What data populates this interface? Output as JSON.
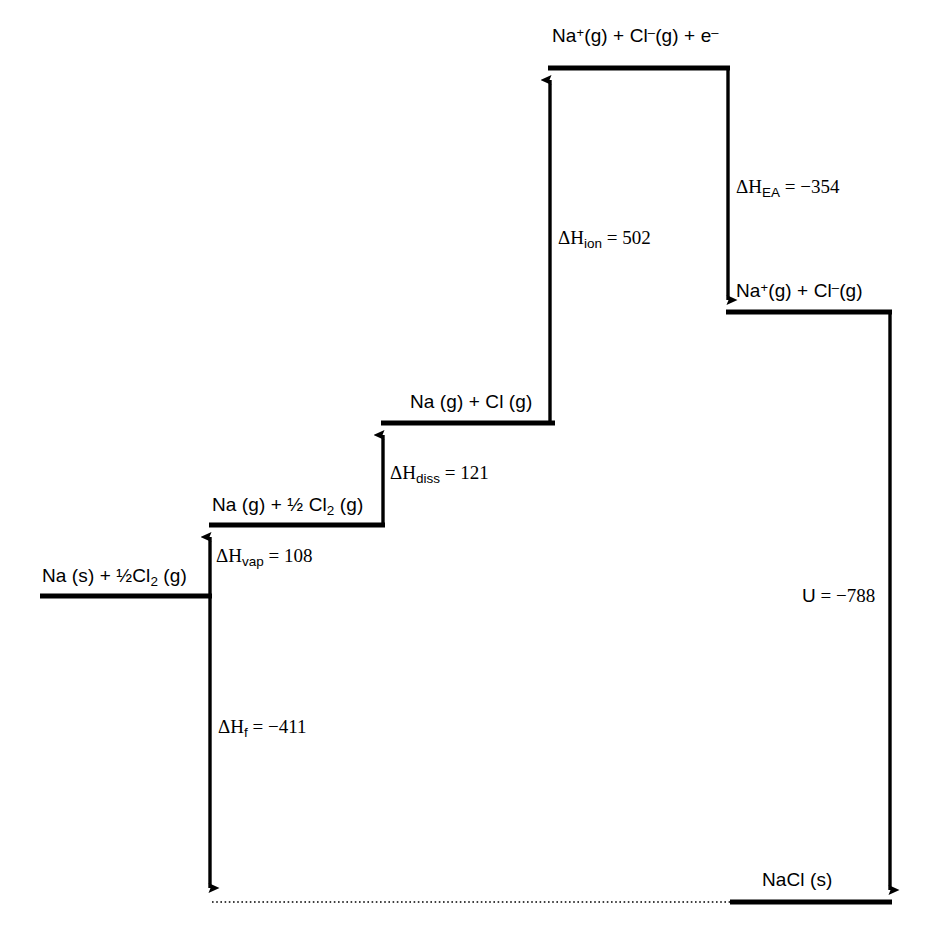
{
  "diagram": {
    "type": "energy-level-diagram",
    "stroke_color": "#000000",
    "background_color": "#ffffff",
    "canvas": {
      "width": 926,
      "height": 935
    },
    "levels": [
      {
        "id": "na-s-half-cl2-g",
        "label_parts": {
          "pre": "Na (s) + ½Cl",
          "sub": "2",
          "post": " (g)"
        },
        "label_text": "Na (s) + ½Cl2 (g)",
        "y": 596,
        "x_start": 40,
        "x_end": 210,
        "label_x": 42,
        "label_y": 566
      },
      {
        "id": "na-g-half-cl2-g",
        "label_parts": {
          "pre": "Na (g) + ½ Cl",
          "sub": "2",
          "post": " (g)"
        },
        "label_text": "Na (g) + ½ Cl2 (g)",
        "y": 525,
        "x_start": 210,
        "x_end": 383,
        "label_x": 212,
        "label_y": 495
      },
      {
        "id": "na-g-cl-g",
        "label_parts": {
          "pre": "Na (g) + Cl (g)",
          "sub": "",
          "post": ""
        },
        "label_text": "Na (g) + Cl (g)",
        "y": 423,
        "x_start": 383,
        "x_end": 553,
        "label_x": 410,
        "label_y": 392
      },
      {
        "id": "na-plus-cl-minus-e",
        "label_parts": {
          "pre": "Na",
          "sub": "",
          "post": ""
        },
        "label_text": "Na+(g) + Cl-(g) + e-",
        "y": 68,
        "x_start": 550,
        "x_end": 728,
        "label_x": 552,
        "label_y": 26
      },
      {
        "id": "na-plus-cl-minus",
        "label_parts": {
          "pre": "Na",
          "sub": "",
          "post": ""
        },
        "label_text": "Na+(g) + Cl-(g)",
        "y": 312,
        "x_start": 728,
        "x_end": 890,
        "label_x": 736,
        "label_y": 281
      },
      {
        "id": "nacl-s",
        "label_parts": {
          "pre": "NaCl (s)",
          "sub": "",
          "post": ""
        },
        "label_text": "NaCl (s)",
        "y": 902,
        "x_start": 730,
        "x_end": 890,
        "label_x": 762,
        "label_y": 870
      }
    ],
    "species_labels": {
      "top_level": {
        "na": "Na",
        "plus": "+",
        "g1": "(g) + Cl",
        "minus": "–",
        "g2": "(g) + e",
        "e_minus": "–"
      },
      "ionic_level": {
        "na": "Na",
        "plus": "+",
        "g1": "(g) + Cl",
        "minus": "–",
        "g2": "(g)"
      },
      "nacl": "NaCl (s)",
      "na_g_cl_g": "Na (g) + Cl (g)"
    },
    "steps": [
      {
        "id": "formation",
        "symbol": "ΔH",
        "subscript": "f",
        "equals": " = ",
        "value": "−411",
        "label_text": "ΔHf = −411",
        "label_x": 218,
        "label_y": 717,
        "arrow": {
          "x": 210,
          "y_from": 596,
          "y_to": 900,
          "direction": "down"
        }
      },
      {
        "id": "vaporisation",
        "symbol": "ΔH",
        "subscript": "vap",
        "equals": " = ",
        "value": "108",
        "label_text": "ΔHvap = 108",
        "label_x": 216,
        "label_y": 546,
        "arrow": {
          "x": 210,
          "y_from": 596,
          "y_to": 525,
          "direction": "up"
        }
      },
      {
        "id": "dissociation",
        "symbol": "ΔH",
        "subscript": "diss",
        "equals": " = ",
        "value": "121",
        "label_text": "ΔHdiss = 121",
        "label_x": 390,
        "label_y": 463,
        "arrow": {
          "x": 383,
          "y_from": 525,
          "y_to": 423,
          "direction": "up"
        }
      },
      {
        "id": "ionisation",
        "symbol": "ΔH",
        "subscript": "ion",
        "equals": " = ",
        "value": "502",
        "label_text": "ΔHion = 502",
        "label_x": 558,
        "label_y": 228,
        "arrow": {
          "x": 550,
          "y_from": 423,
          "y_to": 68,
          "direction": "up"
        }
      },
      {
        "id": "electron-affinity",
        "symbol": "ΔH",
        "subscript": "EA",
        "equals": " = ",
        "value": "−354",
        "label_text": "ΔHEA = −354",
        "label_x": 736,
        "label_y": 177,
        "arrow": {
          "x": 728,
          "y_from": 68,
          "y_to": 312,
          "direction": "down"
        }
      },
      {
        "id": "lattice-energy",
        "symbol": "U",
        "subscript": "",
        "equals": " = ",
        "value": "−788",
        "label_text": "U = −788",
        "label_x": 802,
        "label_y": 586,
        "arrow": {
          "x": 890,
          "y_from": 312,
          "y_to": 900,
          "direction": "down"
        }
      }
    ],
    "guide_line": {
      "id": "baseline-dotted",
      "style": "dotted",
      "y": 902,
      "x_start": 212,
      "x_end": 730
    }
  }
}
